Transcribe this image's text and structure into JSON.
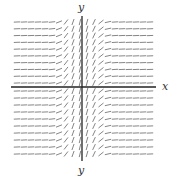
{
  "chart_data": {
    "type": "slope_field",
    "title": "",
    "xlabel": "x",
    "ylabel_top": "y",
    "ylabel_bottom": "y",
    "grid_columns": 20,
    "grid_rows": 20,
    "rows_above_axis": 10,
    "rows_below_axis": 10,
    "slope_description": "Slope depends only on x: near-vertical at x≈0, decreasing toward horizontal as |x| grows; positive on both sides.",
    "x_range": [
      -5,
      5
    ],
    "y_range": [
      -5,
      5
    ],
    "grid": false,
    "colors": {
      "segments": "#666666",
      "axes": "#222222",
      "background": "#ffffff"
    }
  },
  "labels": {
    "x": "x",
    "y_top": "y",
    "y_bottom": "y"
  }
}
